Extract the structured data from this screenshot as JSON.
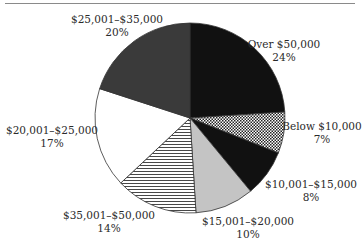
{
  "chart_data": {
    "type": "pie",
    "title": "",
    "start_angle_deg": 0,
    "direction": "clockwise",
    "slices": [
      {
        "label": "Over $50,000",
        "value": 24,
        "pct_label": "24%",
        "fill": "#111111",
        "pattern": "solid"
      },
      {
        "label": "Below $10,000",
        "value": 7,
        "pct_label": "7%",
        "fill": "#ffffff",
        "pattern": "checker"
      },
      {
        "label": "$10,001–$15,000",
        "value": 8,
        "pct_label": "8%",
        "fill": "#111111",
        "pattern": "solid"
      },
      {
        "label": "$15,001–$20,000",
        "value": 10,
        "pct_label": "10%",
        "fill": "#c4c4c4",
        "pattern": "solid"
      },
      {
        "label": "$35,001–$50,000",
        "value": 14,
        "pct_label": "14%",
        "fill": "#ffffff",
        "pattern": "horizontal-lines"
      },
      {
        "label": "$20,001–$25,000",
        "value": 17,
        "pct_label": "17%",
        "fill": "#ffffff",
        "pattern": "solid"
      },
      {
        "label": "$25,001–$35,000",
        "value": 20,
        "pct_label": "20%",
        "fill": "#3a3a3a",
        "pattern": "solid"
      }
    ],
    "legend": "none",
    "labels_position": "outside"
  },
  "labels": {
    "over50": {
      "name": "Over $50,000",
      "pct": "24%"
    },
    "below10": {
      "name": "Below $10,000",
      "pct": "7%"
    },
    "r10_15": {
      "name": "$10,001–$15,000",
      "pct": "8%"
    },
    "r15_20": {
      "name": "$15,001–$20,000",
      "pct": "10%"
    },
    "r35_50": {
      "name": "$35,001–$50,000",
      "pct": "14%"
    },
    "r20_25": {
      "name": "$20,001–$25,000",
      "pct": "17%"
    },
    "r25_35": {
      "name": "$25,001–$35,000",
      "pct": "20%"
    }
  }
}
